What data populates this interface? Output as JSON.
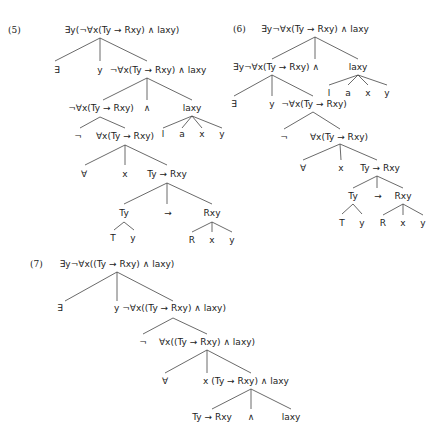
{
  "trees": [
    {
      "id": "5",
      "number": "(5)",
      "nodes": [
        {
          "label": "∃y(¬∀x(Ty → Rxy) ∧ laxy)",
          "x": 122,
          "y": 30
        },
        {
          "label": "∃",
          "x": 57,
          "y": 70
        },
        {
          "label": "y",
          "x": 100,
          "y": 70
        },
        {
          "label": "¬∀x(Ty → Rxy) ∧ laxy",
          "x": 158,
          "y": 70
        },
        {
          "label": "¬∀x(Ty → Rxy)",
          "x": 101,
          "y": 108
        },
        {
          "label": "∧",
          "x": 147,
          "y": 108
        },
        {
          "label": "laxy",
          "x": 192,
          "y": 108
        },
        {
          "label": "¬",
          "x": 78,
          "y": 136
        },
        {
          "label": "∀x(Ty → Rxy)",
          "x": 125,
          "y": 136
        },
        {
          "label": "l",
          "x": 163,
          "y": 134
        },
        {
          "label": "a",
          "x": 182,
          "y": 134
        },
        {
          "label": "x",
          "x": 202,
          "y": 134
        },
        {
          "label": "y",
          "x": 222,
          "y": 134
        },
        {
          "label": "∀",
          "x": 84,
          "y": 174
        },
        {
          "label": "x",
          "x": 125,
          "y": 174
        },
        {
          "label": "Ty → Rxy",
          "x": 167,
          "y": 174
        },
        {
          "label": "Ty",
          "x": 124,
          "y": 213
        },
        {
          "label": "→",
          "x": 168,
          "y": 213
        },
        {
          "label": "Rxy",
          "x": 212,
          "y": 213
        },
        {
          "label": "T",
          "x": 113,
          "y": 238
        },
        {
          "label": "y",
          "x": 133,
          "y": 238
        },
        {
          "label": "R",
          "x": 192,
          "y": 240
        },
        {
          "label": "x",
          "x": 212,
          "y": 240
        },
        {
          "label": "y",
          "x": 232,
          "y": 240
        }
      ],
      "edges": [
        [
          100,
          38,
          55,
          61
        ],
        [
          100,
          38,
          100,
          61
        ],
        [
          100,
          38,
          147,
          61
        ],
        [
          147,
          78,
          103,
          100
        ],
        [
          147,
          78,
          147,
          100
        ],
        [
          147,
          78,
          192,
          100
        ],
        [
          100,
          117,
          80,
          128
        ],
        [
          100,
          117,
          125,
          128
        ],
        [
          192,
          116,
          163,
          128
        ],
        [
          192,
          116,
          182,
          128
        ],
        [
          192,
          116,
          202,
          128
        ],
        [
          192,
          116,
          222,
          128
        ],
        [
          125,
          145,
          85,
          165
        ],
        [
          125,
          145,
          125,
          165
        ],
        [
          125,
          145,
          167,
          165
        ],
        [
          167,
          183,
          124,
          204
        ],
        [
          167,
          183,
          167,
          204
        ],
        [
          167,
          183,
          212,
          204
        ],
        [
          124,
          222,
          114,
          230
        ],
        [
          124,
          222,
          134,
          230
        ],
        [
          212,
          222,
          192,
          232
        ],
        [
          212,
          222,
          212,
          232
        ],
        [
          212,
          222,
          232,
          232
        ]
      ]
    },
    {
      "id": "6",
      "number": "(6)",
      "nodes": [
        {
          "label": "∃y¬∀x(Ty → Rxy) ∧ laxy",
          "x": 315,
          "y": 29
        },
        {
          "label": "∃y¬∀x(Ty → Rxy) ∧",
          "x": 276,
          "y": 67
        },
        {
          "label": "laxy",
          "x": 358,
          "y": 67
        },
        {
          "label": "l",
          "x": 329,
          "y": 93
        },
        {
          "label": "a",
          "x": 348,
          "y": 93
        },
        {
          "label": "x",
          "x": 368,
          "y": 93
        },
        {
          "label": "y",
          "x": 387,
          "y": 93
        },
        {
          "label": "∃",
          "x": 234,
          "y": 104
        },
        {
          "label": "y",
          "x": 272,
          "y": 104
        },
        {
          "label": "¬∀x(Ty → Rxy)",
          "x": 314,
          "y": 104
        },
        {
          "label": "¬",
          "x": 284,
          "y": 137
        },
        {
          "label": "∀x(Ty → Rxy)",
          "x": 339,
          "y": 137
        },
        {
          "label": "∀",
          "x": 303,
          "y": 168
        },
        {
          "label": "x",
          "x": 341,
          "y": 168
        },
        {
          "label": "Ty → Rxy",
          "x": 380,
          "y": 168
        },
        {
          "label": "Ty",
          "x": 353,
          "y": 196
        },
        {
          "label": "→",
          "x": 378,
          "y": 196
        },
        {
          "label": "Rxy",
          "x": 403,
          "y": 196
        },
        {
          "label": "T",
          "x": 342,
          "y": 223
        },
        {
          "label": "y",
          "x": 362,
          "y": 223
        },
        {
          "label": "R",
          "x": 383,
          "y": 223
        },
        {
          "label": "x",
          "x": 403,
          "y": 223
        },
        {
          "label": "y",
          "x": 423,
          "y": 223
        }
      ],
      "edges": [
        [
          315,
          37,
          272,
          59
        ],
        [
          315,
          37,
          315,
          59
        ],
        [
          315,
          37,
          358,
          59
        ],
        [
          272,
          75,
          234,
          96
        ],
        [
          272,
          75,
          272,
          96
        ],
        [
          272,
          75,
          313,
          96
        ],
        [
          358,
          75,
          329,
          85
        ],
        [
          358,
          75,
          348,
          85
        ],
        [
          358,
          75,
          368,
          85
        ],
        [
          358,
          75,
          387,
          85
        ],
        [
          313,
          112,
          284,
          129
        ],
        [
          313,
          112,
          340,
          129
        ],
        [
          340,
          144,
          303,
          160
        ],
        [
          340,
          144,
          341,
          160
        ],
        [
          340,
          144,
          377,
          160
        ],
        [
          377,
          176,
          353,
          188
        ],
        [
          377,
          176,
          377,
          188
        ],
        [
          377,
          176,
          403,
          188
        ],
        [
          353,
          204,
          342,
          214
        ],
        [
          353,
          204,
          362,
          214
        ],
        [
          403,
          204,
          383,
          215
        ],
        [
          403,
          204,
          403,
          215
        ],
        [
          403,
          204,
          423,
          215
        ]
      ]
    },
    {
      "id": "7",
      "number": "(7)",
      "nodes": [
        {
          "label": "∃y¬∀x((Ty → Rxy) ∧ laxy)",
          "x": 117,
          "y": 264
        },
        {
          "label": "∃",
          "x": 60,
          "y": 308
        },
        {
          "label": "y ¬∀x((Ty → Rxy) ∧ laxy)",
          "x": 170,
          "y": 308
        },
        {
          "label": "¬",
          "x": 143,
          "y": 342
        },
        {
          "label": "∀x((Ty → Rxy) ∧ laxy)",
          "x": 207,
          "y": 342
        },
        {
          "label": "∀",
          "x": 165,
          "y": 381
        },
        {
          "label": "x (Ty → Rxy) ∧ laxy",
          "x": 246,
          "y": 381
        },
        {
          "label": "Ty → Rxy",
          "x": 212,
          "y": 417
        },
        {
          "label": "∧",
          "x": 251,
          "y": 417
        },
        {
          "label": "laxy",
          "x": 291,
          "y": 417
        }
      ],
      "edges": [
        [
          117,
          272,
          65,
          301
        ],
        [
          117,
          272,
          117,
          301
        ],
        [
          117,
          272,
          173,
          301
        ],
        [
          173,
          318,
          143,
          334
        ],
        [
          173,
          318,
          207,
          334
        ],
        [
          207,
          350,
          165,
          373
        ],
        [
          207,
          350,
          207,
          373
        ],
        [
          207,
          350,
          251,
          373
        ],
        [
          251,
          389,
          212,
          409
        ],
        [
          251,
          389,
          251,
          409
        ],
        [
          251,
          389,
          291,
          409
        ]
      ]
    }
  ],
  "number_positions": {
    "5": {
      "x": 8,
      "y": 30
    },
    "6": {
      "x": 233,
      "y": 29
    },
    "7": {
      "x": 30,
      "y": 264
    }
  }
}
